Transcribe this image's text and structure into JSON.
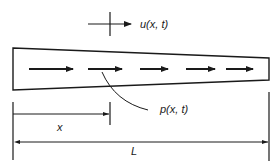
{
  "diagram": {
    "displacement_label": "u(x, t)",
    "load_label": "p(x, t)",
    "position_label": "x",
    "length_label": "L",
    "load_arrow_count": 5,
    "colors": {
      "ink": "#1a1a1a",
      "background": "#ffffff"
    }
  }
}
